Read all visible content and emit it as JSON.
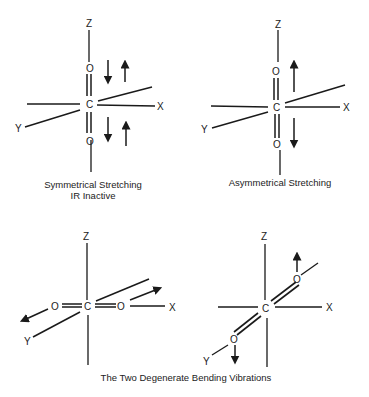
{
  "diagram": {
    "molecule": "CO2",
    "axis_labels": {
      "x": "X",
      "y": "Y",
      "z": "Z"
    },
    "atoms": {
      "carbon": "C",
      "oxygen": "O"
    },
    "panels": [
      {
        "id": "symmetrical",
        "caption_line1": "Symmetrical Stretching",
        "caption_line2": "IR Inactive"
      },
      {
        "id": "asymmetrical",
        "caption_line1": "Asymmetrical Stretching"
      },
      {
        "id": "bending-1"
      },
      {
        "id": "bending-2"
      }
    ],
    "bottom_caption": "The Two Degenerate Bending Vibrations",
    "colors": {
      "ink": "#1a1a1a",
      "background": "#ffffff"
    }
  }
}
